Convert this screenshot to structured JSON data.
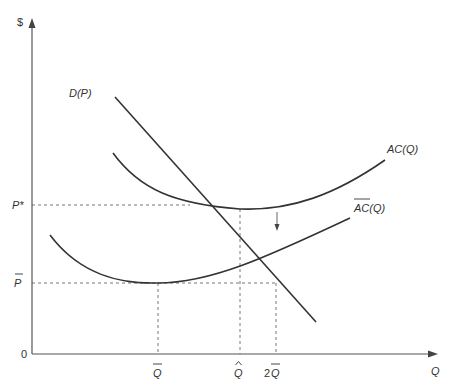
{
  "diagram": {
    "title": "",
    "axes": {
      "y_label": "$",
      "x_label": "Q",
      "origin_label": "0"
    },
    "price_levels": [
      {
        "id": "p_star",
        "label": "P*",
        "y": 205
      },
      {
        "id": "p_bar",
        "label": "P̄",
        "y": 283
      }
    ],
    "quantity_levels": [
      {
        "id": "q_bar",
        "label": "Q̄",
        "x": 158
      },
      {
        "id": "q_hat",
        "label": "Q̂",
        "x": 240
      },
      {
        "id": "two_q_bar",
        "label": "2Q̄",
        "x": 276
      }
    ],
    "curves": [
      {
        "id": "demand",
        "label": "D(P)"
      },
      {
        "id": "ac",
        "label": "AC(Q)"
      },
      {
        "id": "ac_bar",
        "label": "AC̄(Q)"
      }
    ],
    "annotation": "downward arrow indicating cost curve shift from AC(Q) to AC̄(Q)",
    "colors": {
      "curve": "#333333",
      "axis": "#555555",
      "guide": "#666666"
    }
  },
  "labels": {
    "y_axis": "$",
    "x_axis": "Q",
    "origin": "0",
    "p_star": "P*",
    "p_bar": "P",
    "q_bar": "Q",
    "q_hat": "Q",
    "two_q_bar_num": "2",
    "two_q_bar_q": "Q",
    "demand": "D(P)",
    "ac": "AC(Q)",
    "ac_bar_main": "AC",
    "ac_bar_suffix": "(Q)"
  }
}
